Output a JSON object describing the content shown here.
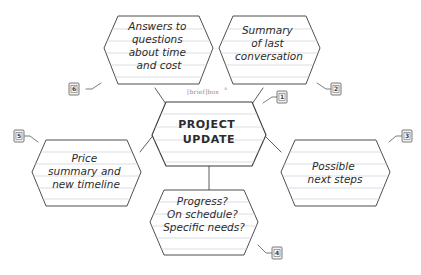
{
  "diagram": {
    "watermark": "[brief]box",
    "background_color": "#ffffff",
    "ink_color": "#2b2b2b",
    "rule_line_color": "#c9cfd6",
    "badge_fill": "#f2f2f2",
    "badge_border": "#5b5b5b",
    "connector_color": "#4a4a4a"
  },
  "nodes": [
    {
      "id": "center",
      "role": "central-topic",
      "badge": "1",
      "badge_position": "upper-right",
      "lines": [
        "PROJECT",
        "UPDATE"
      ],
      "style": "uppercase"
    },
    {
      "id": "top-left",
      "role": "branch",
      "badge": "6",
      "badge_position": "lower-left",
      "lines": [
        "Answers to",
        "questions",
        "about time",
        "and cost"
      ],
      "style": "handwritten"
    },
    {
      "id": "top-right",
      "role": "branch",
      "badge": "2",
      "badge_position": "lower-right",
      "lines": [
        "Summary",
        "of last",
        "conversation"
      ],
      "style": "handwritten"
    },
    {
      "id": "left",
      "role": "branch",
      "badge": "5",
      "badge_position": "upper-left",
      "lines": [
        "Price",
        "summary and",
        "new timeline"
      ],
      "style": "handwritten"
    },
    {
      "id": "right",
      "role": "branch",
      "badge": "3",
      "badge_position": "upper-right",
      "lines": [
        "Possible",
        "next steps"
      ],
      "style": "handwritten"
    },
    {
      "id": "bottom",
      "role": "branch",
      "badge": "4",
      "badge_position": "lower-right",
      "lines": [
        "Progress?",
        "On schedule?",
        "Specific needs?"
      ],
      "style": "handwritten"
    }
  ]
}
